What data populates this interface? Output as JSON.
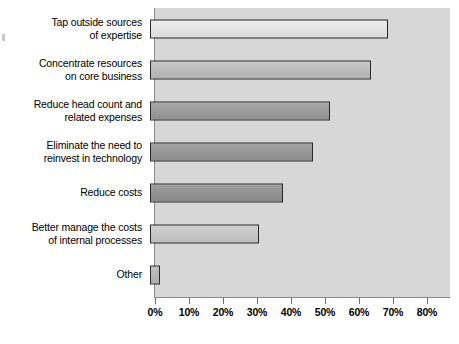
{
  "chart_data": {
    "type": "bar",
    "orientation": "horizontal",
    "title": "",
    "subtitle": "",
    "xlabel": "",
    "ylabel": "",
    "categories": [
      "Tap outside sources\nof expertise",
      "Concentrate resources\non core business",
      "Reduce head count and\nrelated expenses",
      "Eliminate the need to\nreinvest in technology",
      "Reduce costs",
      "Better manage the costs\nof internal processes",
      "Other"
    ],
    "values": [
      70,
      65,
      53,
      48,
      39,
      32,
      3
    ],
    "value_labels": [
      "70%",
      "65%",
      "53%",
      "48%",
      "39%",
      "32%",
      "3%"
    ],
    "xlim": [
      0,
      80
    ],
    "xtick_values": [
      0,
      10,
      20,
      30,
      40,
      50,
      60,
      70,
      80
    ],
    "xtick_labels": [
      "0%",
      "10%",
      "20%",
      "30%",
      "40%",
      "50%",
      "60%",
      "70%",
      "80%"
    ],
    "grid": false,
    "legend": null,
    "legend_position": "none",
    "bar_colors": [
      "#e4e4e4",
      "#bcbcbc",
      "#9b9b9b",
      "#969696",
      "#929292",
      "#c6c6c6",
      "#b8b8b8"
    ],
    "bar_border_color": "#2a2a2a",
    "plot_background": "#d7d7d7",
    "axis_color": "#8a8a8a",
    "text_color": "#000000"
  }
}
